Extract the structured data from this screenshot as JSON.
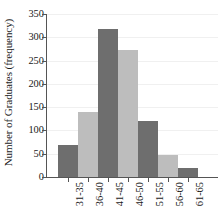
{
  "chart_data": {
    "type": "bar",
    "title": "",
    "xlabel": "",
    "ylabel": "Number of Graduates (frequency)",
    "categories": [
      "31-35",
      "36-40",
      "41-45",
      "46-50",
      "51-55",
      "56-60",
      "61-65"
    ],
    "values": [
      68,
      140,
      317,
      273,
      120,
      48,
      20
    ],
    "ylim": [
      0,
      350
    ],
    "yticks": [
      0,
      50,
      100,
      150,
      200,
      250,
      300,
      350
    ],
    "ytick_labels": [
      "0",
      "50",
      "100",
      "150",
      "200",
      "250",
      "300",
      "350"
    ],
    "grid": true,
    "legend": "none",
    "bar_colors": [
      "#6e6e6e",
      "#bdbdbd",
      "#6e6e6e",
      "#bdbdbd",
      "#6e6e6e",
      "#bdbdbd",
      "#6e6e6e"
    ],
    "axis_color": "#555555",
    "gridline_color": "#f0f0f0",
    "background": "#ffffff",
    "xtick_rotation": 90
  }
}
